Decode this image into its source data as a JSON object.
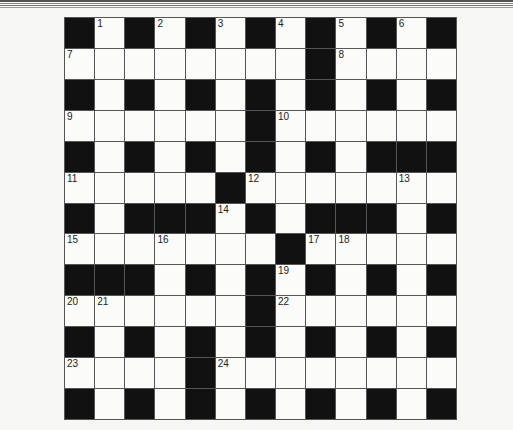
{
  "puzzle": {
    "type": "crossword",
    "size": {
      "rows": 13,
      "cols": 13
    },
    "grid": [
      "#.#.#.#.#.#.#",
      "........#....",
      "#.#.#.#.#.#.#",
      "......#......",
      "#.#.#.#.#.###",
      ".....#.......",
      "#.###.#.###.#",
      ".......#.....",
      "###.#.#.#.#.#",
      "......#......",
      "#.#.#.#.#.#.#",
      "....#........",
      "#.#.#.#.#.#.#"
    ],
    "numbers": [
      {
        "n": "1",
        "r": 0,
        "c": 1
      },
      {
        "n": "2",
        "r": 0,
        "c": 3
      },
      {
        "n": "3",
        "r": 0,
        "c": 5
      },
      {
        "n": "4",
        "r": 0,
        "c": 7
      },
      {
        "n": "5",
        "r": 0,
        "c": 9
      },
      {
        "n": "6",
        "r": 0,
        "c": 11
      },
      {
        "n": "7",
        "r": 1,
        "c": 0
      },
      {
        "n": "8",
        "r": 1,
        "c": 9
      },
      {
        "n": "9",
        "r": 3,
        "c": 0
      },
      {
        "n": "10",
        "r": 3,
        "c": 7
      },
      {
        "n": "11",
        "r": 5,
        "c": 0
      },
      {
        "n": "12",
        "r": 5,
        "c": 6
      },
      {
        "n": "13",
        "r": 5,
        "c": 11
      },
      {
        "n": "14",
        "r": 6,
        "c": 5
      },
      {
        "n": "15",
        "r": 7,
        "c": 0
      },
      {
        "n": "16",
        "r": 7,
        "c": 3
      },
      {
        "n": "17",
        "r": 7,
        "c": 8
      },
      {
        "n": "18",
        "r": 7,
        "c": 9
      },
      {
        "n": "19",
        "r": 8,
        "c": 7
      },
      {
        "n": "20",
        "r": 9,
        "c": 0
      },
      {
        "n": "21",
        "r": 9,
        "c": 1
      },
      {
        "n": "22",
        "r": 9,
        "c": 7
      },
      {
        "n": "23",
        "r": 11,
        "c": 0
      },
      {
        "n": "24",
        "r": 11,
        "c": 5
      }
    ]
  },
  "colors": {
    "black_cell": "#111111",
    "white_cell": "#fbfbfa",
    "grid_line": "#555555",
    "page": "#f7f7f5"
  }
}
